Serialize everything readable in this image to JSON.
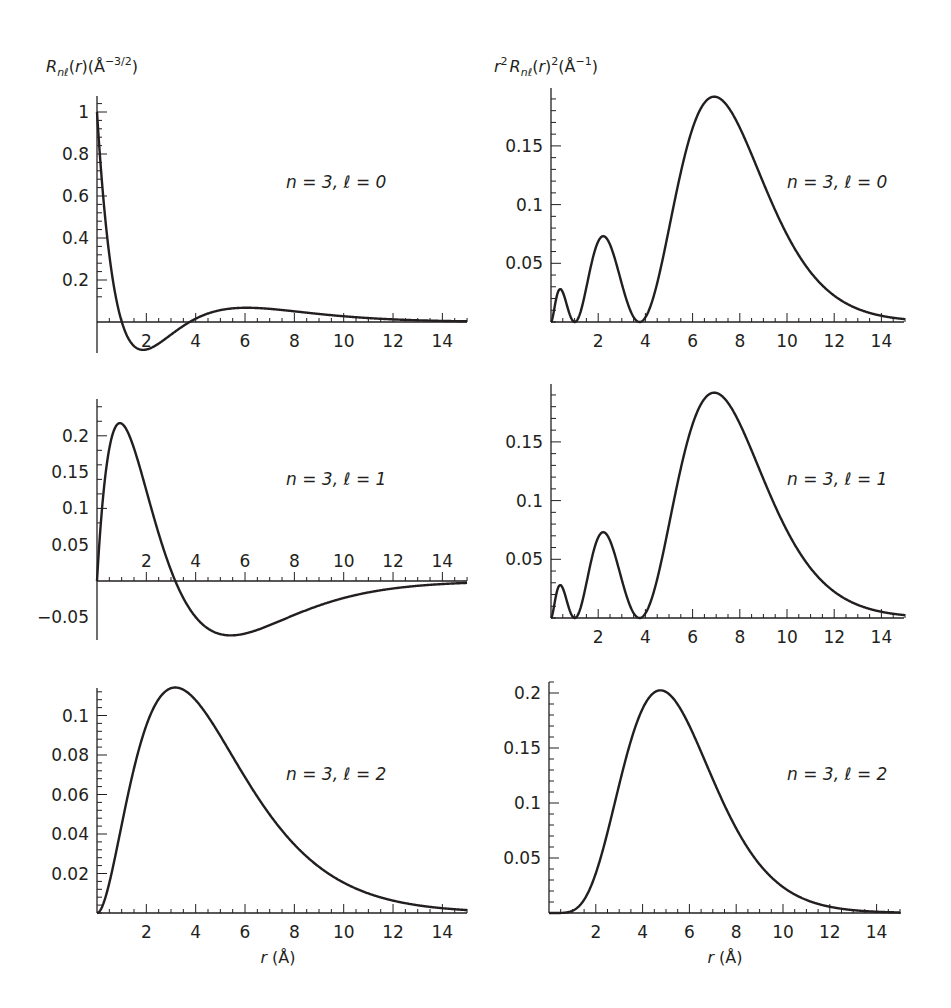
{
  "figure": {
    "left_column_ylabel": "R_nℓ(r)(Å^-3/2)",
    "right_column_ylabel": "r^2 R_nℓ(r)^2(Å^-1)",
    "xlabel": "r (Å)"
  },
  "chart_data": [
    {
      "id": "p1",
      "type": "line",
      "column": "left",
      "row": 1,
      "title": "",
      "annotation": "n = 3, ℓ = 0",
      "xlabel": "",
      "ylabel": "R_nℓ(r) (Å^-3/2)",
      "function": "radial_wavefunction",
      "n": 3,
      "l": 0,
      "xlim": [
        0,
        15
      ],
      "ylim": [
        -0.07,
        1.08
      ],
      "xticks": [
        2,
        4,
        6,
        8,
        10,
        12,
        14
      ],
      "yticks": [
        0.2,
        0.4,
        0.6,
        0.8,
        1
      ],
      "ytick_labels": [
        "0.2",
        "0.4",
        "0.6",
        "0.8",
        "1"
      ],
      "x_labels_position": "below-axis",
      "points": [
        [
          0,
          0.98
        ],
        [
          0.5,
          0.42
        ],
        [
          1,
          0.05
        ],
        [
          1.5,
          -0.11
        ],
        [
          2,
          -0.13
        ],
        [
          3,
          -0.07
        ],
        [
          4,
          0.0
        ],
        [
          5,
          0.04
        ],
        [
          6,
          0.052
        ],
        [
          7,
          0.05
        ],
        [
          8,
          0.04
        ],
        [
          10,
          0.02
        ],
        [
          12,
          0.008
        ],
        [
          14,
          0.003
        ],
        [
          15,
          0.002
        ]
      ]
    },
    {
      "id": "p2",
      "type": "line",
      "column": "right",
      "row": 1,
      "title": "",
      "annotation": "n = 3, ℓ = 0",
      "xlabel": "",
      "ylabel": "r^2 R_nℓ(r)^2 (Å^-1)",
      "function": "radial_probability",
      "n": 3,
      "l": 0,
      "xlim": [
        0,
        15
      ],
      "ylim": [
        0,
        0.2
      ],
      "xticks": [
        2,
        4,
        6,
        8,
        10,
        12,
        14
      ],
      "yticks": [
        0.05,
        0.1,
        0.15
      ],
      "ytick_labels": [
        "0.05",
        "0.1",
        "0.15"
      ],
      "x_labels_position": "below-axis",
      "points": [
        [
          0,
          0
        ],
        [
          0.4,
          0.027
        ],
        [
          1.0,
          0
        ],
        [
          2.2,
          0.073
        ],
        [
          3.8,
          0
        ],
        [
          5,
          0.09
        ],
        [
          7,
          0.191
        ],
        [
          8,
          0.17
        ],
        [
          10,
          0.08
        ],
        [
          12,
          0.025
        ],
        [
          14,
          0.006
        ],
        [
          15,
          0.003
        ]
      ]
    },
    {
      "id": "p3",
      "type": "line",
      "column": "left",
      "row": 2,
      "title": "",
      "annotation": "n = 3, ℓ = 1",
      "xlabel": "",
      "ylabel": "",
      "function": "radial_wavefunction",
      "n": 3,
      "l": 1,
      "xlim": [
        0,
        15
      ],
      "ylim": [
        -0.08,
        0.25
      ],
      "xticks": [
        2,
        4,
        6,
        8,
        10,
        12,
        14
      ],
      "yticks": [
        -0.05,
        0.05,
        0.1,
        0.15,
        0.2
      ],
      "ytick_labels": [
        "−0.05",
        "0.05",
        "0.1",
        "0.15",
        "0.2"
      ],
      "x_labels_position": "above-axis",
      "points": [
        [
          0,
          0
        ],
        [
          0.5,
          0.17
        ],
        [
          1,
          0.215
        ],
        [
          2,
          0.1
        ],
        [
          3.2,
          0
        ],
        [
          4,
          -0.05
        ],
        [
          5.5,
          -0.076
        ],
        [
          7,
          -0.06
        ],
        [
          10,
          -0.025
        ],
        [
          12,
          -0.012
        ],
        [
          15,
          -0.003
        ]
      ]
    },
    {
      "id": "p4",
      "type": "line",
      "column": "right",
      "row": 2,
      "title": "",
      "annotation": "n = 3, ℓ = 1",
      "xlabel": "",
      "ylabel": "",
      "function": "radial_probability",
      "n": 3,
      "l": 0,
      "xlim": [
        0,
        15
      ],
      "ylim": [
        0,
        0.2
      ],
      "xticks": [
        2,
        4,
        6,
        8,
        10,
        12,
        14
      ],
      "yticks": [
        0.05,
        0.1,
        0.15
      ],
      "ytick_labels": [
        "0.05",
        "0.1",
        "0.15"
      ],
      "x_labels_position": "below-axis",
      "points": [
        [
          0,
          0
        ],
        [
          0.4,
          0.027
        ],
        [
          1.0,
          0
        ],
        [
          2.2,
          0.073
        ],
        [
          3.8,
          0
        ],
        [
          5,
          0.09
        ],
        [
          7,
          0.191
        ],
        [
          8,
          0.17
        ],
        [
          10,
          0.08
        ],
        [
          12,
          0.025
        ],
        [
          14,
          0.006
        ],
        [
          15,
          0.003
        ]
      ]
    },
    {
      "id": "p5",
      "type": "line",
      "column": "left",
      "row": 3,
      "title": "",
      "annotation": "n = 3, ℓ = 2",
      "xlabel": "r (Å)",
      "ylabel": "",
      "function": "radial_wavefunction",
      "n": 3,
      "l": 2,
      "xlim": [
        0,
        15
      ],
      "ylim": [
        0,
        0.115
      ],
      "xticks": [
        2,
        4,
        6,
        8,
        10,
        12,
        14
      ],
      "yticks": [
        0.02,
        0.04,
        0.06,
        0.08,
        0.1
      ],
      "ytick_labels": [
        "0.02",
        "0.04",
        "0.06",
        "0.08",
        "0.1"
      ],
      "x_labels_position": "below-axis",
      "points": [
        [
          0,
          0
        ],
        [
          1,
          0.05
        ],
        [
          2,
          0.095
        ],
        [
          3.2,
          0.114
        ],
        [
          4,
          0.108
        ],
        [
          6,
          0.07
        ],
        [
          8,
          0.035
        ],
        [
          10,
          0.015
        ],
        [
          12,
          0.006
        ],
        [
          15,
          0.002
        ]
      ]
    },
    {
      "id": "p6",
      "type": "line",
      "column": "right",
      "row": 3,
      "title": "",
      "annotation": "n = 3, ℓ = 2",
      "xlabel": "r (Å)",
      "ylabel": "",
      "function": "radial_probability",
      "n": 3,
      "l": 2,
      "xlim": [
        0,
        15
      ],
      "ylim": [
        0,
        0.21
      ],
      "xticks": [
        2,
        4,
        6,
        8,
        10,
        12,
        14
      ],
      "yticks": [
        0.05,
        0.1,
        0.15,
        0.2
      ],
      "ytick_labels": [
        "0.05",
        "0.1",
        "0.15",
        "0.2"
      ],
      "x_labels_position": "below-axis",
      "points": [
        [
          0,
          0
        ],
        [
          1,
          0.002
        ],
        [
          2,
          0.04
        ],
        [
          3,
          0.13
        ],
        [
          4.8,
          0.202
        ],
        [
          6,
          0.17
        ],
        [
          8,
          0.07
        ],
        [
          10,
          0.018
        ],
        [
          12,
          0.004
        ],
        [
          14,
          0.0005
        ],
        [
          15,
          0
        ]
      ]
    }
  ]
}
